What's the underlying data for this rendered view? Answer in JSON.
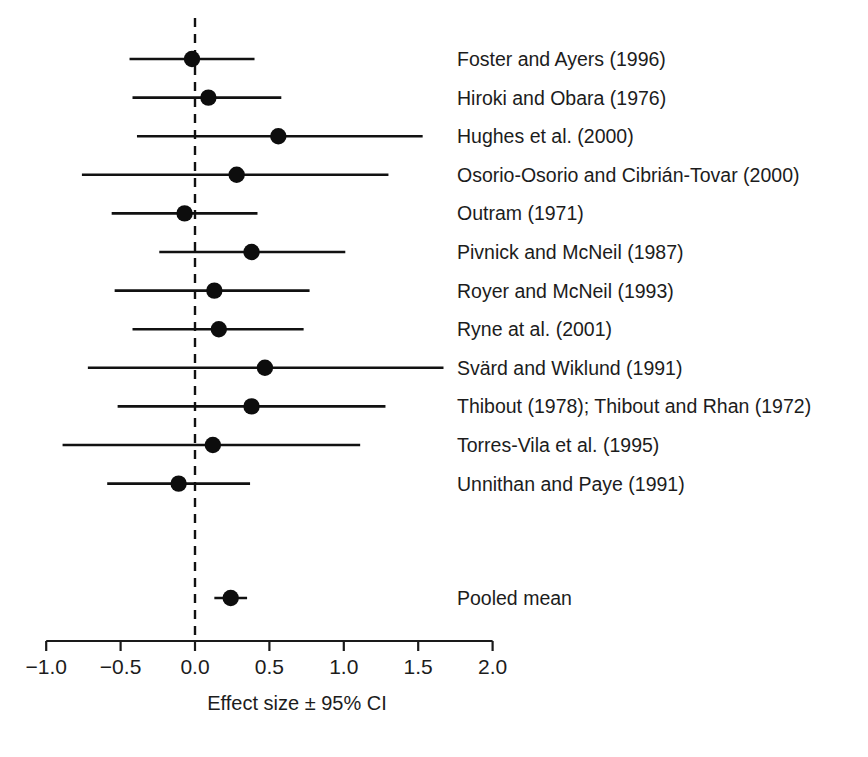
{
  "chart_data": {
    "type": "scatter",
    "subtype": "forest-plot",
    "title": "",
    "xlabel": "Effect size ± 95% CI",
    "ylabel": "",
    "xlim": [
      -1.25,
      2.1
    ],
    "xticks": [
      -1.0,
      -0.5,
      0.0,
      0.5,
      1.0,
      1.5,
      2.0
    ],
    "xticklabels": [
      "−1.0",
      "−0.5",
      "0.0",
      "0.5",
      "1.0",
      "1.5",
      "2.0"
    ],
    "grid": false,
    "legend": "none",
    "reference_line": 0.0,
    "reference_line_style": "dashed",
    "categories": [
      "Foster and Ayers (1996)",
      "Hiroki and Obara (1976)",
      "Hughes et al. (2000)",
      "Osorio-Osorio and Cibrián-Tovar (2000)",
      "Outram (1971)",
      "Pivnick and McNeil (1987)",
      "Royer and McNeil (1993)",
      "Ryne at al. (2001)",
      "Svärd and Wiklund (1991)",
      "Thibout (1978); Thibout and Rhan (1972)",
      "Torres-Vila et al. (1995)",
      "Unnithan and Paye (1991)",
      "Pooled mean"
    ],
    "studies": [
      {
        "label": "Foster and Ayers (1996)",
        "effect": -0.02,
        "ci_low": -0.44,
        "ci_high": 0.4,
        "pooled": false
      },
      {
        "label": "Hiroki and Obara (1976)",
        "effect": 0.09,
        "ci_low": -0.42,
        "ci_high": 0.58,
        "pooled": false
      },
      {
        "label": "Hughes et al. (2000)",
        "effect": 0.56,
        "ci_low": -0.39,
        "ci_high": 1.53,
        "pooled": false
      },
      {
        "label": "Osorio-Osorio and Cibrián-Tovar (2000)",
        "effect": 0.28,
        "ci_low": -0.76,
        "ci_high": 1.3,
        "pooled": false
      },
      {
        "label": "Outram (1971)",
        "effect": -0.07,
        "ci_low": -0.56,
        "ci_high": 0.42,
        "pooled": false
      },
      {
        "label": "Pivnick and McNeil (1987)",
        "effect": 0.38,
        "ci_low": -0.24,
        "ci_high": 1.01,
        "pooled": false
      },
      {
        "label": "Royer and McNeil (1993)",
        "effect": 0.13,
        "ci_low": -0.54,
        "ci_high": 0.77,
        "pooled": false
      },
      {
        "label": "Ryne at al. (2001)",
        "effect": 0.16,
        "ci_low": -0.42,
        "ci_high": 0.73,
        "pooled": false
      },
      {
        "label": "Svärd and Wiklund (1991)",
        "effect": 0.47,
        "ci_low": -0.72,
        "ci_high": 1.67,
        "pooled": false
      },
      {
        "label": "Thibout (1978); Thibout and Rhan (1972)",
        "effect": 0.38,
        "ci_low": -0.52,
        "ci_high": 1.28,
        "pooled": false
      },
      {
        "label": "Torres-Vila et al. (1995)",
        "effect": 0.12,
        "ci_low": -0.89,
        "ci_high": 1.11,
        "pooled": false
      },
      {
        "label": "Unnithan and Paye (1991)",
        "effect": -0.11,
        "ci_low": -0.59,
        "ci_high": 0.37,
        "pooled": false
      },
      {
        "label": "Pooled mean",
        "effect": 0.24,
        "ci_low": 0.13,
        "ci_high": 0.35,
        "pooled": true
      }
    ],
    "colors": {
      "marker": "#0d0d0d",
      "line": "#111111",
      "axis": "#1a1a1a",
      "text": "#1c1c1c",
      "background": "#ffffff"
    }
  }
}
